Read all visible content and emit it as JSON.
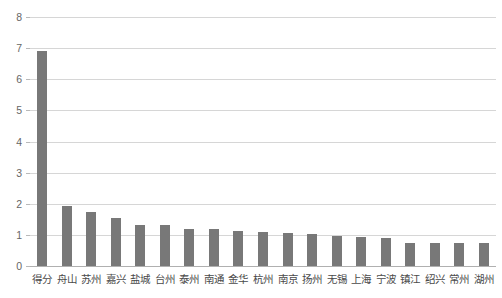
{
  "chart_data": {
    "type": "bar",
    "title": "",
    "xlabel": "",
    "ylabel": "",
    "ylim": [
      0,
      8
    ],
    "ytick_labels": [
      "0",
      "1",
      "2",
      "3",
      "4",
      "5",
      "6",
      "7",
      "8"
    ],
    "yticks": [
      0,
      1,
      2,
      3,
      4,
      5,
      6,
      7,
      8
    ],
    "grid": true,
    "legend": false,
    "bar_color": "#787878",
    "gridline_color": "#d6d6d6",
    "categories": [
      "得分",
      "舟山",
      "苏州",
      "嘉兴",
      "盐城",
      "台州",
      "泰州",
      "南通",
      "金华",
      "杭州",
      "南京",
      "扬州",
      "无锡",
      "上海",
      "宁波",
      "镇江",
      "绍兴",
      "常州",
      "湖州"
    ],
    "values": [
      6.9,
      1.93,
      1.72,
      1.55,
      1.33,
      1.32,
      1.2,
      1.18,
      1.12,
      1.08,
      1.06,
      1.03,
      0.98,
      0.93,
      0.9,
      0.75,
      0.74,
      0.73,
      0.73
    ]
  }
}
